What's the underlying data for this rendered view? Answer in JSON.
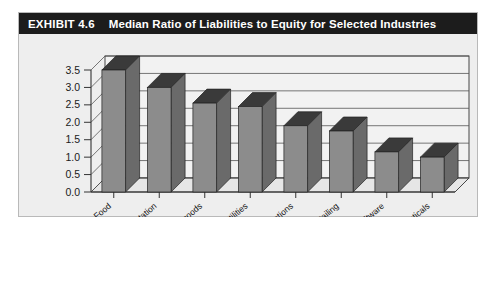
{
  "exhibit": {
    "number": "EXHIBIT 4.6",
    "title": "Median Ratio of Liabilities to Equity for Selected Industries"
  },
  "colors": {
    "title_bar_bg": "#1c1c1c",
    "title_text": "#ffffff",
    "card_bg": "#eeeeee",
    "plot_bg": "#f2f2f2",
    "bar_front": "#8c8c8c",
    "bar_top": "#3a3a3a",
    "bar_side": "#6a6a6a",
    "gridline": "#555555",
    "axis": "#333333"
  },
  "chart_data": {
    "type": "bar",
    "title": "Median Ratio of Liabilities to Equity for Selected Industries",
    "xlabel": "",
    "ylabel": "",
    "categories": [
      "Food",
      "Transportation",
      "Capital goods",
      "Utilities",
      "Telecommunications",
      "Retailing",
      "Software",
      "Pharmaceuticals"
    ],
    "values": [
      3.5,
      3.0,
      2.55,
      2.45,
      1.9,
      1.75,
      1.15,
      1.0
    ],
    "ylim": [
      0.0,
      3.5
    ],
    "ytick_labels": [
      "0.0",
      "0.5",
      "1.0",
      "1.5",
      "2.0",
      "2.5",
      "3.0",
      "3.5"
    ],
    "ytick_values": [
      0.0,
      0.5,
      1.0,
      1.5,
      2.0,
      2.5,
      3.0,
      3.5
    ],
    "grid": true,
    "legend": "none",
    "style": "3d-column"
  }
}
